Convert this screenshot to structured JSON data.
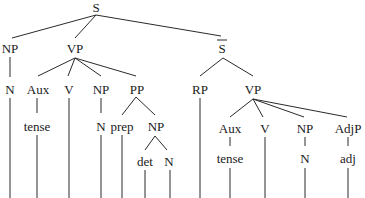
{
  "diagram": {
    "type": "syntax-tree",
    "nodes": {
      "s": "S",
      "np1": "NP",
      "vp1": "VP",
      "sbar": "S",
      "n1": "N",
      "aux1": "Aux",
      "v1": "V",
      "np2": "NP",
      "pp": "PP",
      "rp": "RP",
      "vp2": "VP",
      "tense1": "tense",
      "n2": "N",
      "prep": "prep",
      "np3": "NP",
      "det": "det",
      "n3": "N",
      "aux2": "Aux",
      "v2": "V",
      "np4": "NP",
      "adjp": "AdjP",
      "tense2": "tense",
      "n4": "N",
      "adj": "adj"
    },
    "note": "Bottom row of terminal words is cropped at the image edge"
  }
}
